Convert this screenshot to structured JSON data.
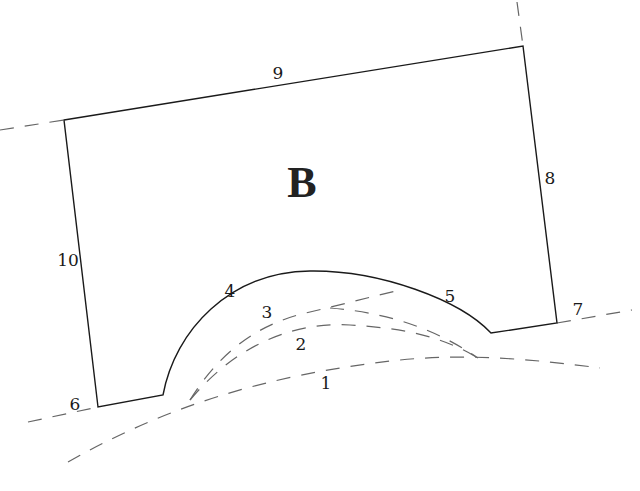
{
  "diagram": {
    "region_label": "B",
    "edge_labels": {
      "l1": "1",
      "l2": "2",
      "l3": "3",
      "l4": "4",
      "l5": "5",
      "l6": "6",
      "l7": "7",
      "l8": "8",
      "l9": "9",
      "l10": "10"
    },
    "colors": {
      "solid_line": "#1a1a1a",
      "dashed_line": "#666666",
      "background": "#ffffff"
    }
  }
}
